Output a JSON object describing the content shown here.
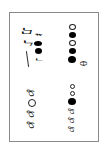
{
  "document": {
    "orientation": "rotated-90",
    "groups": [
      {
        "id": "top-left",
        "symbols": [
          "♫",
          "♪",
          "𝄽",
          "♩"
        ]
      },
      {
        "id": "top-right",
        "symbols": [
          "o",
          "●",
          "o",
          "●",
          "●",
          "θ"
        ]
      },
      {
        "id": "bottom-left",
        "symbols": [
          "℘",
          "o",
          "℘",
          "℘"
        ]
      },
      {
        "id": "bottom-right",
        "symbols": [
          "o",
          "●",
          "℘",
          "℘",
          "℘"
        ]
      }
    ]
  }
}
